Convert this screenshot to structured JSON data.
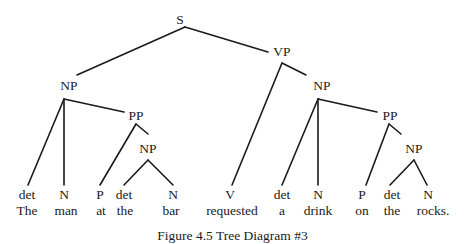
{
  "diagram": {
    "type": "syntax-tree",
    "sentence": "The man at the bar requested a drink on the rocks.",
    "caption": "Figure 4.5 Tree Diagram #3",
    "nodes": {
      "root": "S",
      "np_subject": "NP",
      "pp_subject": "PP",
      "np_subject_inner": "NP",
      "vp": "VP",
      "np_object": "NP",
      "pp_object": "PP",
      "np_object_inner": "NP"
    },
    "leaves": [
      {
        "category": "det",
        "word": "The"
      },
      {
        "category": "N",
        "word": "man"
      },
      {
        "category": "P",
        "word": "at"
      },
      {
        "category": "det",
        "word": "the"
      },
      {
        "category": "N",
        "word": "bar"
      },
      {
        "category": "V",
        "word": "requested"
      },
      {
        "category": "det",
        "word": "a"
      },
      {
        "category": "N",
        "word": "drink"
      },
      {
        "category": "P",
        "word": "on"
      },
      {
        "category": "det",
        "word": "the"
      },
      {
        "category": "N",
        "word": "rocks."
      }
    ]
  }
}
